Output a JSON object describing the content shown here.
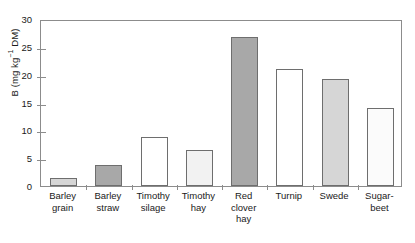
{
  "chart_data": {
    "type": "bar",
    "title": "",
    "xlabel": "",
    "ylabel": "B (mg kg⁻¹ DM)",
    "ylabel_parts": {
      "pre": "B (mg kg",
      "sup": "−1",
      "post": " DM)"
    },
    "ylim": [
      0,
      30
    ],
    "yticks": [
      0,
      5,
      10,
      15,
      20,
      25,
      30
    ],
    "ytick_labels": [
      "0",
      "5",
      "10",
      "15",
      "20",
      "25",
      "30"
    ],
    "grid": false,
    "legend": "none",
    "categories": [
      "Barley grain",
      "Barley straw",
      "Timothy silage",
      "Timothy hay",
      "Red clover hay",
      "Turnip",
      "Swede",
      "Sugar-beet"
    ],
    "category_lines": [
      [
        "Barley",
        "grain"
      ],
      [
        "Barley",
        "straw"
      ],
      [
        "Timothy",
        "silage"
      ],
      [
        "Timothy",
        "hay"
      ],
      [
        "Red",
        "clover",
        "hay"
      ],
      [
        "Turnip"
      ],
      [
        "Swede"
      ],
      [
        "Sugar-",
        "beet"
      ]
    ],
    "values": [
      1.5,
      3.7,
      8.8,
      6.4,
      26.8,
      21.0,
      19.2,
      14.0
    ],
    "bar_fills": [
      "#d6d6d6",
      "#a8a8a8",
      "#ffffff",
      "#f2f2f2",
      "#a8a8a8",
      "#ffffff",
      "#d6d6d6",
      "#fbfbfb"
    ],
    "bar_edge_color": "#6e6e6e",
    "axis_color": "#8c8c8c"
  }
}
